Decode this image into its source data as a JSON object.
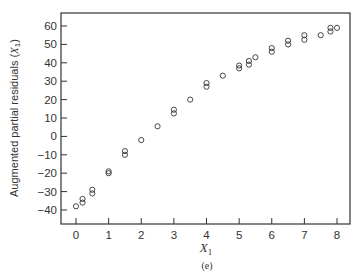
{
  "chart_data": {
    "type": "scatter",
    "title": "",
    "xlabel": "X1",
    "ylabel": "Augmented partial residuals (X1)",
    "panel_label": "(e)",
    "xlim": [
      -0.45,
      8.3
    ],
    "ylim": [
      -45,
      67
    ],
    "xticks": [
      0,
      1,
      2,
      3,
      4,
      5,
      6,
      7,
      8
    ],
    "yticks": [
      -40,
      -30,
      -20,
      -10,
      0,
      10,
      20,
      30,
      40,
      50,
      60
    ],
    "grid": false,
    "legend": null,
    "marker": "open-circle",
    "series": [
      {
        "name": "augmented partial residuals",
        "points": [
          [
            0.0,
            -38
          ],
          [
            0.2,
            -36
          ],
          [
            0.2,
            -34
          ],
          [
            0.5,
            -31
          ],
          [
            0.5,
            -29
          ],
          [
            1.0,
            -20
          ],
          [
            1.0,
            -19
          ],
          [
            1.5,
            -10
          ],
          [
            1.5,
            -8
          ],
          [
            2.0,
            -2
          ],
          [
            2.5,
            5.5
          ],
          [
            3.0,
            12.5
          ],
          [
            3.0,
            14.5
          ],
          [
            3.5,
            20
          ],
          [
            4.0,
            27
          ],
          [
            4.0,
            29
          ],
          [
            4.5,
            33
          ],
          [
            5.0,
            37
          ],
          [
            5.0,
            38.5
          ],
          [
            5.3,
            39
          ],
          [
            5.3,
            41
          ],
          [
            5.5,
            43
          ],
          [
            6.0,
            46
          ],
          [
            6.0,
            48
          ],
          [
            6.5,
            50
          ],
          [
            6.5,
            52
          ],
          [
            7.0,
            52.5
          ],
          [
            7.0,
            55
          ],
          [
            7.5,
            55
          ],
          [
            7.8,
            57
          ],
          [
            7.8,
            59
          ],
          [
            8.0,
            59
          ]
        ]
      }
    ]
  },
  "labels": {
    "ylabel_main": "Augmented partial residuals (",
    "ylabel_var": "X",
    "ylabel_sub": "1",
    "ylabel_close": ")",
    "xlabel_var": "X",
    "xlabel_sub": "1",
    "panel": "(e)"
  }
}
